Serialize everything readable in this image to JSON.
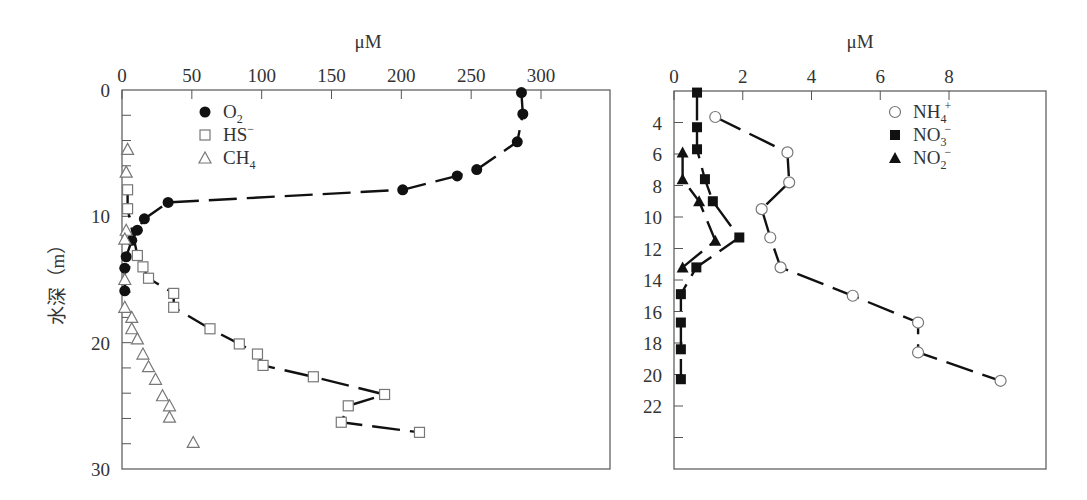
{
  "chart_data": [
    {
      "type": "scatter",
      "panel": "left",
      "title": "",
      "xlabel": "μM",
      "ylabel": "水深（m）",
      "xlim": [
        0,
        330
      ],
      "ylim": [
        30,
        0
      ],
      "x_axis_position": "top",
      "x_ticks": [
        0,
        50,
        100,
        150,
        200,
        250,
        300
      ],
      "y_ticks_labeled": [
        0,
        10,
        20,
        30
      ],
      "y_minor_tick_step": 2,
      "grid": false,
      "legend_position": "upper left",
      "series": [
        {
          "name": "O2",
          "label_main": "O",
          "label_sub": "2",
          "label_sup": "",
          "marker": "filled-circle",
          "line": "dashed-solid fit",
          "points": [
            [
              286,
              0.2
            ],
            [
              287,
              1.9
            ],
            [
              283,
              4.1
            ],
            [
              254,
              6.3
            ],
            [
              240,
              6.8
            ],
            [
              201,
              7.9
            ],
            [
              33,
              8.9
            ],
            [
              16,
              10.2
            ],
            [
              11,
              11.1
            ],
            [
              7,
              11.9
            ],
            [
              3,
              13.2
            ],
            [
              2,
              14.1
            ],
            [
              2,
              15.9
            ]
          ]
        },
        {
          "name": "HS-",
          "label_main": "HS",
          "label_sub": "",
          "label_sup": "−",
          "marker": "open-square",
          "line": "dashed fit",
          "points": [
            [
              4,
              7.9
            ],
            [
              4,
              9.4
            ],
            [
              11,
              13.1
            ],
            [
              15,
              14.0
            ],
            [
              19,
              14.9
            ],
            [
              37,
              16.1
            ],
            [
              37,
              17.2
            ],
            [
              63,
              18.9
            ],
            [
              84,
              20.1
            ],
            [
              97,
              20.9
            ],
            [
              101,
              21.8
            ],
            [
              137,
              22.7
            ],
            [
              188,
              24.1
            ],
            [
              162,
              25.0
            ],
            [
              157,
              26.3
            ],
            [
              213,
              27.1
            ]
          ]
        },
        {
          "name": "CH4",
          "label_main": "CH",
          "label_sub": "4",
          "label_sup": "",
          "marker": "open-triangle",
          "line": "none",
          "points": [
            [
              4,
              4.7
            ],
            [
              3,
              6.5
            ],
            [
              3,
              11.1
            ],
            [
              2,
              11.8
            ],
            [
              2,
              15.0
            ],
            [
              2,
              17.2
            ],
            [
              7,
              18.0
            ],
            [
              7,
              18.9
            ],
            [
              11,
              19.7
            ],
            [
              15,
              20.9
            ],
            [
              19,
              21.9
            ],
            [
              24,
              22.9
            ],
            [
              29,
              24.2
            ],
            [
              34,
              25.0
            ],
            [
              34,
              25.9
            ],
            [
              51,
              27.9
            ]
          ]
        }
      ]
    },
    {
      "type": "scatter",
      "panel": "right",
      "title": "",
      "xlabel": "μM",
      "ylabel": "",
      "xlim": [
        0,
        10.8
      ],
      "ylim": [
        26,
        2
      ],
      "x_axis_position": "top",
      "x_ticks": [
        0,
        2,
        4,
        6,
        8
      ],
      "y_ticks_labeled": [
        4,
        6,
        8,
        10,
        12,
        14,
        16,
        18,
        20,
        22
      ],
      "y_unlabeled_ticks": [
        24
      ],
      "grid": false,
      "legend_position": "upper right",
      "series": [
        {
          "name": "NH4+",
          "label_main": "NH",
          "label_sub": "4",
          "label_sup": "+",
          "marker": "open-circle",
          "line": "dashed-solid fit",
          "points": [
            [
              1.2,
              3.65
            ],
            [
              3.3,
              5.9
            ],
            [
              3.35,
              7.8
            ],
            [
              2.55,
              9.5
            ],
            [
              2.8,
              11.3
            ],
            [
              3.1,
              13.2
            ],
            [
              5.2,
              15.0
            ],
            [
              7.1,
              16.7
            ],
            [
              7.1,
              18.6
            ],
            [
              9.5,
              20.4
            ]
          ]
        },
        {
          "name": "NO3-",
          "label_main": "NO",
          "label_sub": "3",
          "label_sup": "−",
          "marker": "filled-square",
          "line": "dashed fit",
          "points": [
            [
              0.67,
              2.1
            ],
            [
              0.67,
              4.3
            ],
            [
              0.67,
              5.7
            ],
            [
              0.9,
              7.6
            ],
            [
              1.13,
              9.0
            ],
            [
              1.9,
              11.3
            ],
            [
              0.65,
              13.2
            ],
            [
              0.2,
              14.9
            ],
            [
              0.2,
              16.7
            ],
            [
              0.2,
              18.4
            ],
            [
              0.2,
              20.3
            ]
          ]
        },
        {
          "name": "NO2-",
          "label_main": "NO",
          "label_sub": "2",
          "label_sup": "−",
          "marker": "filled-triangle",
          "line": "dashed fit",
          "points": [
            [
              0.25,
              5.9
            ],
            [
              0.25,
              7.6
            ],
            [
              0.73,
              9.0
            ],
            [
              1.2,
              11.5
            ],
            [
              0.25,
              13.2
            ]
          ]
        }
      ]
    }
  ],
  "colors": {
    "axis": "#555555",
    "marker": "#111111",
    "open_marker": "#777777",
    "line": "#111111"
  }
}
